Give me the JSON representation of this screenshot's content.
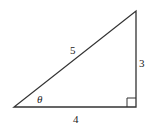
{
  "diagram": {
    "type": "right-triangle",
    "labels": {
      "hypotenuse": "5",
      "opposite": "3",
      "adjacent": "4",
      "angle": "θ"
    },
    "colors": {
      "stroke": "#333333",
      "text": "#222222",
      "background": "#ffffff"
    }
  }
}
